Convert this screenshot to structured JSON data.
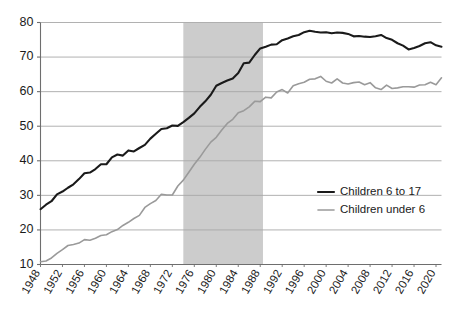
{
  "chart_data": {
    "type": "line",
    "title": "",
    "subtitle": "",
    "xlabel": "",
    "ylabel": "",
    "xlim": [
      1948,
      2021
    ],
    "ylim": [
      10,
      80
    ],
    "grid": "horizontal",
    "legend_position": "inside-lower-right",
    "x_tick_labels": [
      "1948",
      "1952",
      "1956",
      "1960",
      "1964",
      "1968",
      "1972",
      "1976",
      "1980",
      "1984",
      "1988",
      "1992",
      "1996",
      "2000",
      "2004",
      "2008",
      "2012",
      "2016",
      "2020"
    ],
    "y_tick_labels": [
      "10",
      "20",
      "30",
      "40",
      "50",
      "60",
      "70",
      "80"
    ],
    "y_ticks": [
      10,
      20,
      30,
      40,
      50,
      60,
      70,
      80
    ],
    "x_ticks": [
      1948,
      1952,
      1956,
      1960,
      1964,
      1968,
      1972,
      1976,
      1980,
      1984,
      1988,
      1992,
      1996,
      2000,
      2004,
      2008,
      2012,
      2016,
      2020
    ],
    "shaded_region": {
      "label": "",
      "x_start": 1974,
      "x_end": 1988.5,
      "color": "#cccccc"
    },
    "x": [
      1948,
      1949,
      1950,
      1951,
      1952,
      1953,
      1954,
      1955,
      1956,
      1957,
      1958,
      1959,
      1960,
      1961,
      1962,
      1963,
      1964,
      1965,
      1966,
      1967,
      1968,
      1969,
      1970,
      1971,
      1972,
      1973,
      1974,
      1975,
      1976,
      1977,
      1978,
      1979,
      1980,
      1981,
      1982,
      1983,
      1984,
      1985,
      1986,
      1987,
      1988,
      1989,
      1990,
      1991,
      1992,
      1993,
      1994,
      1995,
      1996,
      1997,
      1998,
      1999,
      2000,
      2001,
      2002,
      2003,
      2004,
      2005,
      2006,
      2007,
      2008,
      2009,
      2010,
      2011,
      2012,
      2013,
      2014,
      2015,
      2016,
      2017,
      2018,
      2019,
      2020,
      2021
    ],
    "series": [
      {
        "name": "Children 6 to 17",
        "color": "#1a1a1a",
        "width": 2.1,
        "values": [
          26.0,
          27.3,
          28.3,
          30.3,
          31.1,
          32.2,
          33.2,
          34.7,
          36.4,
          36.6,
          37.6,
          39.0,
          39.0,
          41.0,
          41.8,
          41.5,
          43.0,
          42.7,
          43.7,
          44.6,
          46.4,
          47.8,
          49.2,
          49.4,
          50.2,
          50.1,
          51.2,
          52.4,
          53.7,
          55.6,
          57.2,
          59.1,
          61.7,
          62.5,
          63.2,
          63.8,
          65.4,
          68.2,
          68.4,
          70.6,
          72.5,
          73.0,
          73.6,
          73.7,
          74.9,
          75.4,
          76.0,
          76.4,
          77.2,
          77.6,
          77.3,
          77.1,
          77.2,
          76.9,
          77.1,
          77.0,
          76.7,
          76.0,
          76.1,
          75.9,
          75.8,
          76.0,
          76.4,
          75.5,
          75.0,
          74.0,
          73.3,
          72.2,
          72.6,
          73.2,
          74.0,
          74.3,
          73.4,
          73.0
        ]
      },
      {
        "name": "Children under 6",
        "color": "#9a9a9a",
        "width": 1.6,
        "values": [
          10.8,
          11.0,
          11.9,
          13.2,
          14.3,
          15.5,
          15.8,
          16.2,
          17.2,
          17.0,
          17.6,
          18.4,
          18.6,
          19.5,
          20.1,
          21.3,
          22.2,
          23.3,
          24.2,
          26.5,
          27.6,
          28.5,
          30.3,
          30.1,
          30.1,
          32.7,
          34.4,
          36.7,
          39.0,
          41.0,
          43.3,
          45.4,
          46.8,
          48.9,
          50.8,
          52.0,
          53.9,
          54.5,
          55.6,
          57.2,
          57.1,
          58.4,
          58.2,
          59.9,
          60.6,
          59.6,
          61.7,
          62.3,
          62.7,
          63.6,
          63.7,
          64.4,
          63.0,
          62.5,
          63.7,
          62.5,
          62.2,
          62.6,
          62.8,
          62.0,
          62.6,
          61.1,
          60.6,
          61.9,
          60.9,
          61.1,
          61.4,
          61.4,
          61.3,
          61.9,
          62.0,
          62.7,
          62.0,
          64.0
        ]
      }
    ]
  },
  "legend": {
    "items": [
      {
        "label": "Children 6 to 17",
        "color": "#1a1a1a"
      },
      {
        "label": "Children under 6",
        "color": "#9a9a9a"
      }
    ]
  },
  "axes": {
    "y_tick_labels": [
      "80",
      "70",
      "60",
      "50",
      "40",
      "30",
      "20",
      "10"
    ],
    "x_tick_labels": [
      "1948",
      "1952",
      "1956",
      "1960",
      "1964",
      "1968",
      "1972",
      "1976",
      "1980",
      "1984",
      "1988",
      "1992",
      "1996",
      "2000",
      "2004",
      "2008",
      "2012",
      "2016",
      "2020"
    ]
  },
  "style": {
    "background": "#ffffff",
    "grid_color": "#a8a8a8",
    "axis_color": "#6e6e6e",
    "band_color": "#cccccc",
    "dark_series_color": "#1a1a1a",
    "light_series_color": "#9a9a9a"
  }
}
